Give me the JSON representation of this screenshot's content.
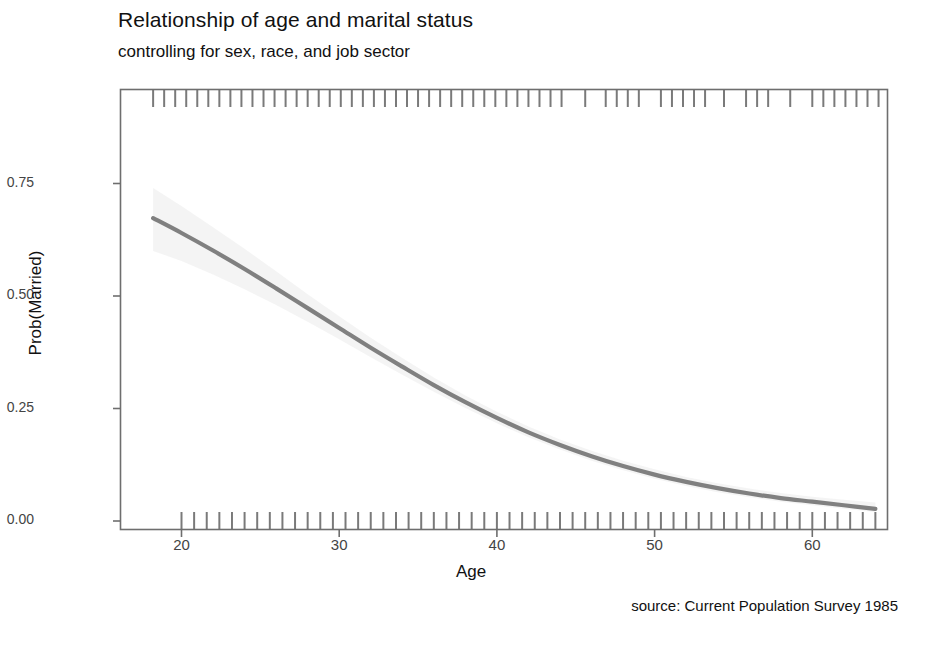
{
  "chart_data": {
    "type": "line",
    "title": "Relationship of age and marital status",
    "subtitle": "controlling for sex, race, and job sector",
    "caption": "source: Current Population Survey 1985",
    "xlabel": "Age",
    "ylabel": "Prob(Married)",
    "xlim": [
      16.1,
      64.8
    ],
    "ylim": [
      -0.02,
      0.96
    ],
    "grid": false,
    "legend": "none",
    "xticks": [
      20,
      30,
      40,
      50,
      60
    ],
    "xtick_labels": [
      "20",
      "30",
      "40",
      "50",
      "60"
    ],
    "yticks": [
      0.0,
      0.25,
      0.5,
      0.75
    ],
    "ytick_labels": [
      "0.00",
      "0.25",
      "0.50",
      "0.75"
    ],
    "line_color": "#808080",
    "band_color": "#f2f2f2",
    "series": [
      {
        "name": "Prob(Married)",
        "x": [
          18.2,
          20,
          22,
          24,
          26,
          28,
          30,
          32,
          34,
          36,
          38,
          40,
          42,
          44,
          46,
          48,
          50,
          52,
          54,
          56,
          58,
          60,
          62,
          64
        ],
        "values": [
          0.673,
          0.64,
          0.601,
          0.56,
          0.517,
          0.473,
          0.429,
          0.385,
          0.343,
          0.302,
          0.264,
          0.229,
          0.197,
          0.169,
          0.144,
          0.122,
          0.103,
          0.087,
          0.073,
          0.061,
          0.051,
          0.043,
          0.035,
          0.027
        ],
        "ci_lower": [
          0.6,
          0.578,
          0.548,
          0.515,
          0.48,
          0.443,
          0.404,
          0.364,
          0.325,
          0.287,
          0.251,
          0.217,
          0.186,
          0.159,
          0.134,
          0.113,
          0.094,
          0.078,
          0.064,
          0.053,
          0.043,
          0.035,
          0.027,
          0.02
        ],
        "ci_upper": [
          0.74,
          0.7,
          0.653,
          0.605,
          0.555,
          0.504,
          0.455,
          0.407,
          0.362,
          0.319,
          0.279,
          0.243,
          0.21,
          0.181,
          0.156,
          0.134,
          0.115,
          0.098,
          0.084,
          0.072,
          0.062,
          0.054,
          0.047,
          0.041
        ]
      }
    ],
    "rug_top": {
      "name": "married-observations-rug",
      "position": "top",
      "values": [
        18.2,
        18.9,
        19.6,
        20.3,
        21.0,
        21.7,
        22.4,
        23.1,
        23.8,
        24.5,
        25.2,
        25.9,
        26.6,
        27.3,
        28.0,
        28.7,
        29.4,
        30.1,
        30.8,
        31.5,
        32.2,
        32.9,
        33.6,
        34.3,
        35.0,
        35.7,
        36.4,
        37.1,
        37.8,
        38.5,
        39.2,
        39.9,
        40.6,
        41.3,
        42.0,
        42.7,
        43.4,
        44.1,
        45.6,
        46.9,
        47.6,
        48.3,
        49.0,
        50.4,
        51.1,
        51.8,
        52.5,
        53.2,
        54.4,
        55.8,
        56.5,
        57.2,
        58.6,
        60.0,
        60.7,
        61.4,
        62.1,
        62.8,
        63.5,
        64.2
      ]
    },
    "rug_bottom": {
      "name": "unmarried-observations-rug",
      "position": "bottom",
      "values": [
        20.0,
        20.8,
        21.6,
        22.4,
        23.2,
        24.0,
        24.8,
        25.6,
        26.4,
        27.2,
        28.0,
        28.8,
        29.6,
        30.4,
        31.2,
        32.0,
        32.8,
        33.6,
        34.4,
        35.2,
        36.0,
        36.8,
        37.6,
        38.4,
        39.2,
        40.0,
        40.8,
        41.6,
        42.4,
        43.2,
        44.0,
        44.8,
        45.6,
        46.4,
        47.2,
        48.0,
        48.8,
        49.6,
        50.4,
        51.2,
        52.0,
        52.8,
        53.6,
        54.4,
        55.2,
        56.0,
        56.8,
        57.6,
        58.4,
        59.2,
        60.0,
        60.8,
        61.6,
        62.4,
        63.2,
        64.0
      ]
    }
  }
}
